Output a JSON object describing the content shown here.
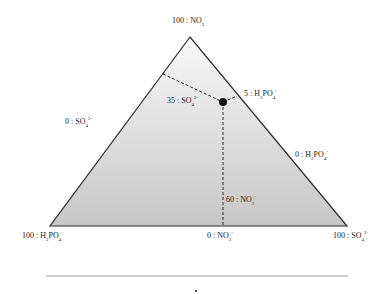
{
  "diagram": {
    "type": "ternary",
    "vertices": {
      "top": {
        "label": "100 : NO",
        "sub": "3",
        "sup": "-"
      },
      "bottom_left": {
        "label": "100 : H",
        "sub": "2",
        "mid": "PO",
        "sub2": "4",
        "sup": "-"
      },
      "bottom_right": {
        "label": "100 : SO",
        "sub": "4",
        "sup": "2-"
      }
    },
    "edges": {
      "left": {
        "label": "0 : SO",
        "sub": "4",
        "sup": "2-"
      },
      "right": {
        "label": "0 : H",
        "sub": "2",
        "mid": "PO",
        "sub2": "4",
        "sup": "-"
      },
      "bottom": {
        "label": "0 : NO",
        "sub": "3",
        "sup": "-"
      }
    },
    "point": {
      "so4_label": {
        "label": "35 : SO",
        "sub": "4",
        "sup": "2-"
      },
      "h2po4_label": {
        "label": "5 : H",
        "sub": "2",
        "mid": "PO",
        "sub2": "4",
        "sup": "-"
      },
      "no3_label": {
        "label": "60 : NO",
        "sub": "3",
        "sup": "-"
      },
      "values": {
        "NO3": 60,
        "SO4": 35,
        "H2PO4": 5
      }
    },
    "colors": {
      "fill_top": "#f8f8f8",
      "fill_bottom": "#c6c6c6",
      "stroke": "#2a2a2a",
      "point": "#111111",
      "rule": "#9a9a9a"
    }
  }
}
